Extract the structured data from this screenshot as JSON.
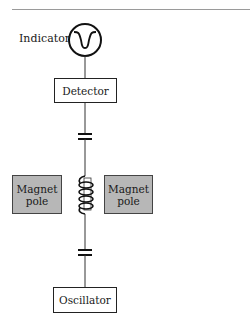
{
  "diagram": {
    "type": "NMR spectrometer schematic",
    "indicator": {
      "label": "Indicator",
      "icon": "absorption-dip-icon"
    },
    "detector": {
      "label": "Detector"
    },
    "capacitors": [
      {
        "name": "upper-capacitor"
      },
      {
        "name": "lower-capacitor"
      }
    ],
    "coil": {
      "name": "sample-coil",
      "turns": 4
    },
    "magnet_left": {
      "line1": "Magnet",
      "line2": "pole"
    },
    "magnet_right": {
      "line1": "Magnet",
      "line2": "pole"
    },
    "oscillator": {
      "label": "Oscillator"
    },
    "colors": {
      "line": "#222222",
      "magnet_fill": "#b7b7b7",
      "rule": "#9a9a9a"
    }
  }
}
